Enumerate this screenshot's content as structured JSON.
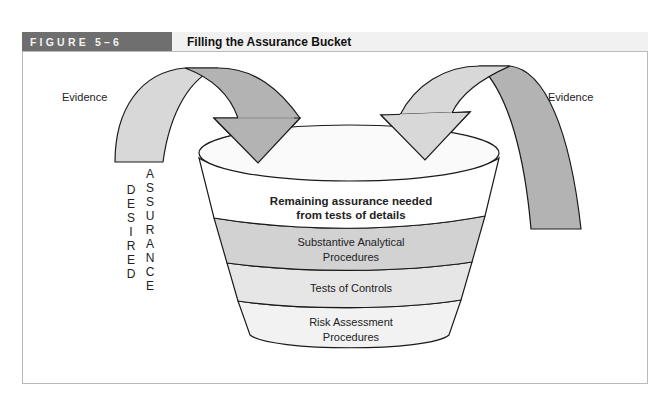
{
  "figure": {
    "label": "FIGURE 5–6",
    "title": "Filling the Assurance Bucket"
  },
  "diagram": {
    "evidence_left": "Evidence",
    "evidence_right": "Evidence",
    "desired_letters": [
      "D",
      "E",
      "S",
      "I",
      "R",
      "E",
      "D"
    ],
    "assurance_letters": [
      "A",
      "S",
      "S",
      "U",
      "R",
      "A",
      "N",
      "C",
      "E"
    ],
    "layers": [
      {
        "line1": "Remaining assurance needed",
        "line2": "from tests of details",
        "fill": "#ffffff",
        "bold": true
      },
      {
        "line1": "Substantive Analytical",
        "line2": "Procedures",
        "fill": "#d2d2d2",
        "bold": false
      },
      {
        "line1": "Tests of Controls",
        "line2": "",
        "fill": "#e6e6e6",
        "bold": false
      },
      {
        "line1": "Risk Assessment",
        "line2": "Procedures",
        "fill": "#f2f2f2",
        "bold": false
      }
    ],
    "colors": {
      "arrow_light": "#d8d8d8",
      "arrow_dark": "#b3b3b3",
      "outline": "#1a1a1a"
    }
  }
}
